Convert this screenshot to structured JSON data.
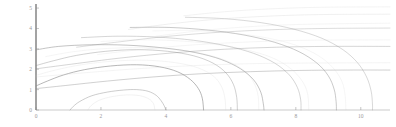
{
  "chart_data": {
    "type": "line",
    "title": "",
    "xlabel": "",
    "ylabel": "",
    "xlim": [
      0,
      10.9
    ],
    "ylim": [
      0,
      5.2
    ],
    "xticks": [
      0,
      2,
      4,
      6,
      8,
      10
    ],
    "xtick_labels": [
      "0",
      "2",
      "4",
      "6",
      "8",
      "10"
    ],
    "yticks": [
      0,
      1,
      2,
      3,
      4,
      5
    ],
    "ytick_labels": [
      "0",
      "1",
      "2",
      "3",
      "4",
      "5"
    ],
    "grid": false,
    "legend": null,
    "annotations": [],
    "axis_color": "#8c8c8c",
    "tick_label_color": "#9a9a9a",
    "contour_color": "#8d8d8d",
    "contour_color_faint": "#c9c9c9",
    "background_color": "#ffffff",
    "series": [
      {
        "name": "dome-1",
        "kind": "closed-arch",
        "opacity": 0.55,
        "width": 0.8,
        "points": [
          [
            1.05,
            0.0
          ],
          [
            1.15,
            0.18
          ],
          [
            1.35,
            0.42
          ],
          [
            1.72,
            0.7
          ],
          [
            2.2,
            0.88
          ],
          [
            2.7,
            0.98
          ],
          [
            3.1,
            1.0
          ],
          [
            3.45,
            0.92
          ],
          [
            3.7,
            0.72
          ],
          [
            3.85,
            0.46
          ],
          [
            3.95,
            0.2
          ],
          [
            4.0,
            0.0
          ]
        ]
      },
      {
        "name": "dome-2",
        "kind": "closed-arch",
        "opacity": 0.75,
        "width": 0.85,
        "points": [
          [
            0.0,
            1.18
          ],
          [
            0.35,
            1.42
          ],
          [
            0.85,
            1.72
          ],
          [
            1.5,
            1.98
          ],
          [
            2.3,
            2.16
          ],
          [
            3.1,
            2.22
          ],
          [
            3.8,
            2.12
          ],
          [
            4.35,
            1.88
          ],
          [
            4.75,
            1.5
          ],
          [
            5.0,
            1.05
          ],
          [
            5.12,
            0.58
          ],
          [
            5.16,
            0.0
          ]
        ]
      },
      {
        "name": "dome-3",
        "kind": "closed-arch",
        "opacity": 0.5,
        "width": 0.8,
        "points": [
          [
            0.0,
            2.18
          ],
          [
            0.55,
            2.42
          ],
          [
            1.25,
            2.68
          ],
          [
            2.15,
            2.88
          ],
          [
            3.1,
            2.96
          ],
          [
            4.05,
            2.88
          ],
          [
            4.85,
            2.66
          ],
          [
            5.45,
            2.3
          ],
          [
            5.85,
            1.82
          ],
          [
            6.08,
            1.25
          ],
          [
            6.18,
            0.62
          ],
          [
            6.2,
            0.0
          ]
        ]
      },
      {
        "name": "dome-4",
        "kind": "closed-arch",
        "opacity": 0.62,
        "width": 0.85,
        "points": [
          [
            0.0,
            2.95
          ],
          [
            0.7,
            3.12
          ],
          [
            1.7,
            3.2
          ],
          [
            2.8,
            3.18
          ],
          [
            3.9,
            3.05
          ],
          [
            4.9,
            2.82
          ],
          [
            5.7,
            2.48
          ],
          [
            6.3,
            2.02
          ],
          [
            6.7,
            1.48
          ],
          [
            6.92,
            0.88
          ],
          [
            7.0,
            0.3
          ],
          [
            7.02,
            0.0
          ]
        ]
      },
      {
        "name": "dome-5",
        "kind": "closed-arch",
        "opacity": 0.45,
        "width": 0.8,
        "points": [
          [
            1.4,
            3.55
          ],
          [
            2.5,
            3.62
          ],
          [
            3.7,
            3.58
          ],
          [
            4.85,
            3.42
          ],
          [
            5.85,
            3.15
          ],
          [
            6.7,
            2.78
          ],
          [
            7.35,
            2.3
          ],
          [
            7.8,
            1.72
          ],
          [
            8.05,
            1.1
          ],
          [
            8.15,
            0.5
          ],
          [
            8.16,
            0.0
          ]
        ]
      },
      {
        "name": "dome-6",
        "kind": "closed-arch",
        "opacity": 0.55,
        "width": 0.85,
        "points": [
          [
            2.9,
            4.05
          ],
          [
            4.1,
            4.05
          ],
          [
            5.3,
            3.92
          ],
          [
            6.4,
            3.68
          ],
          [
            7.35,
            3.32
          ],
          [
            8.1,
            2.86
          ],
          [
            8.65,
            2.3
          ],
          [
            9.0,
            1.68
          ],
          [
            9.18,
            1.02
          ],
          [
            9.24,
            0.42
          ],
          [
            9.25,
            0.0
          ]
        ]
      },
      {
        "name": "dome-7",
        "kind": "closed-arch",
        "opacity": 0.42,
        "width": 0.8,
        "points": [
          [
            4.6,
            4.55
          ],
          [
            5.8,
            4.48
          ],
          [
            6.95,
            4.28
          ],
          [
            7.95,
            3.96
          ],
          [
            8.8,
            3.52
          ],
          [
            9.45,
            2.96
          ],
          [
            9.9,
            2.32
          ],
          [
            10.18,
            1.62
          ],
          [
            10.32,
            0.92
          ],
          [
            10.36,
            0.3
          ],
          [
            10.36,
            0.0
          ]
        ]
      },
      {
        "name": "open-1",
        "kind": "open-sweep",
        "opacity": 0.5,
        "width": 0.8,
        "points": [
          [
            0.0,
            1.05
          ],
          [
            0.9,
            1.2
          ],
          [
            2.2,
            1.42
          ],
          [
            3.6,
            1.62
          ],
          [
            5.1,
            1.78
          ],
          [
            6.6,
            1.88
          ],
          [
            8.1,
            1.94
          ],
          [
            9.6,
            1.96
          ],
          [
            10.9,
            1.96
          ]
        ]
      },
      {
        "name": "open-2",
        "kind": "open-sweep",
        "opacity": 0.45,
        "width": 0.8,
        "points": [
          [
            0.0,
            2.02
          ],
          [
            1.1,
            2.25
          ],
          [
            2.6,
            2.55
          ],
          [
            4.2,
            2.8
          ],
          [
            5.8,
            2.98
          ],
          [
            7.4,
            3.08
          ],
          [
            9.0,
            3.12
          ],
          [
            10.9,
            3.12
          ]
        ]
      },
      {
        "name": "open-3",
        "kind": "open-sweep",
        "opacity": 0.4,
        "width": 0.75,
        "points": [
          [
            1.25,
            3.08
          ],
          [
            2.6,
            3.35
          ],
          [
            4.1,
            3.62
          ],
          [
            5.7,
            3.82
          ],
          [
            7.3,
            3.94
          ],
          [
            8.9,
            4.0
          ],
          [
            10.9,
            4.02
          ]
        ]
      },
      {
        "name": "open-4",
        "kind": "open-sweep",
        "opacity": 0.38,
        "width": 0.75,
        "points": [
          [
            2.85,
            3.95
          ],
          [
            4.1,
            4.22
          ],
          [
            5.55,
            4.45
          ],
          [
            7.1,
            4.6
          ],
          [
            8.7,
            4.68
          ],
          [
            10.9,
            4.7
          ]
        ]
      },
      {
        "name": "open-5",
        "kind": "open-sweep",
        "opacity": 0.32,
        "width": 0.7,
        "points": [
          [
            4.55,
            4.62
          ],
          [
            5.8,
            4.82
          ],
          [
            7.2,
            4.96
          ],
          [
            8.8,
            5.04
          ],
          [
            10.9,
            5.06
          ]
        ]
      },
      {
        "name": "open-6",
        "kind": "open-sweep",
        "opacity": 0.3,
        "width": 0.7,
        "points": [
          [
            0.0,
            1.62
          ],
          [
            1.3,
            1.8
          ],
          [
            2.9,
            2.0
          ],
          [
            4.6,
            2.16
          ],
          [
            6.3,
            2.26
          ],
          [
            8.0,
            2.3
          ],
          [
            10.9,
            2.32
          ]
        ]
      },
      {
        "name": "open-7",
        "kind": "open-sweep",
        "opacity": 0.28,
        "width": 0.7,
        "points": [
          [
            1.9,
            2.72
          ],
          [
            3.3,
            2.98
          ],
          [
            4.9,
            3.2
          ],
          [
            6.6,
            3.34
          ],
          [
            8.3,
            3.42
          ],
          [
            10.9,
            3.44
          ]
        ]
      },
      {
        "name": "open-8",
        "kind": "open-sweep",
        "opacity": 0.26,
        "width": 0.7,
        "points": [
          [
            3.7,
            3.62
          ],
          [
            5.0,
            3.88
          ],
          [
            6.5,
            4.08
          ],
          [
            8.2,
            4.2
          ],
          [
            10.9,
            4.26
          ]
        ]
      },
      {
        "name": "inner-ridge-1",
        "kind": "closed-arch",
        "opacity": 0.35,
        "width": 0.7,
        "points": [
          [
            1.6,
            0.0
          ],
          [
            1.7,
            0.22
          ],
          [
            1.95,
            0.48
          ],
          [
            2.35,
            0.66
          ],
          [
            2.8,
            0.74
          ],
          [
            3.2,
            0.7
          ],
          [
            3.48,
            0.54
          ],
          [
            3.62,
            0.3
          ],
          [
            3.66,
            0.0
          ]
        ]
      },
      {
        "name": "inner-ridge-2",
        "kind": "closed-arch",
        "opacity": 0.3,
        "width": 0.7,
        "points": [
          [
            0.0,
            1.7
          ],
          [
            0.6,
            1.96
          ],
          [
            1.4,
            2.22
          ],
          [
            2.4,
            2.4
          ],
          [
            3.4,
            2.44
          ],
          [
            4.3,
            2.32
          ],
          [
            5.0,
            2.06
          ],
          [
            5.48,
            1.64
          ],
          [
            5.72,
            1.12
          ],
          [
            5.82,
            0.55
          ],
          [
            5.84,
            0.0
          ]
        ]
      },
      {
        "name": "inner-ridge-3",
        "kind": "closed-arch",
        "opacity": 0.28,
        "width": 0.7,
        "points": [
          [
            0.3,
            2.62
          ],
          [
            1.15,
            2.86
          ],
          [
            2.2,
            3.02
          ],
          [
            3.3,
            3.06
          ],
          [
            4.35,
            2.96
          ],
          [
            5.25,
            2.72
          ],
          [
            5.95,
            2.36
          ],
          [
            6.45,
            1.88
          ],
          [
            6.72,
            1.3
          ],
          [
            6.84,
            0.68
          ],
          [
            6.86,
            0.0
          ]
        ]
      },
      {
        "name": "inner-ridge-4",
        "kind": "closed-arch",
        "opacity": 0.26,
        "width": 0.7,
        "points": [
          [
            2.0,
            3.36
          ],
          [
            3.1,
            3.44
          ],
          [
            4.3,
            3.4
          ],
          [
            5.45,
            3.24
          ],
          [
            6.45,
            2.96
          ],
          [
            7.25,
            2.58
          ],
          [
            7.82,
            2.06
          ],
          [
            8.18,
            1.46
          ],
          [
            8.36,
            0.82
          ],
          [
            8.4,
            0.0
          ]
        ]
      },
      {
        "name": "inner-ridge-5",
        "kind": "closed-arch",
        "opacity": 0.24,
        "width": 0.7,
        "points": [
          [
            3.6,
            3.88
          ],
          [
            4.8,
            3.9
          ],
          [
            6.0,
            3.78
          ],
          [
            7.1,
            3.54
          ],
          [
            8.0,
            3.18
          ],
          [
            8.7,
            2.66
          ],
          [
            9.15,
            2.06
          ],
          [
            9.42,
            1.4
          ],
          [
            9.52,
            0.7
          ],
          [
            9.54,
            0.0
          ]
        ]
      }
    ]
  },
  "figure": {
    "plot_area": {
      "left": 36,
      "top": 4,
      "right": 390,
      "bottom": 110
    },
    "tick_length": 3
  }
}
